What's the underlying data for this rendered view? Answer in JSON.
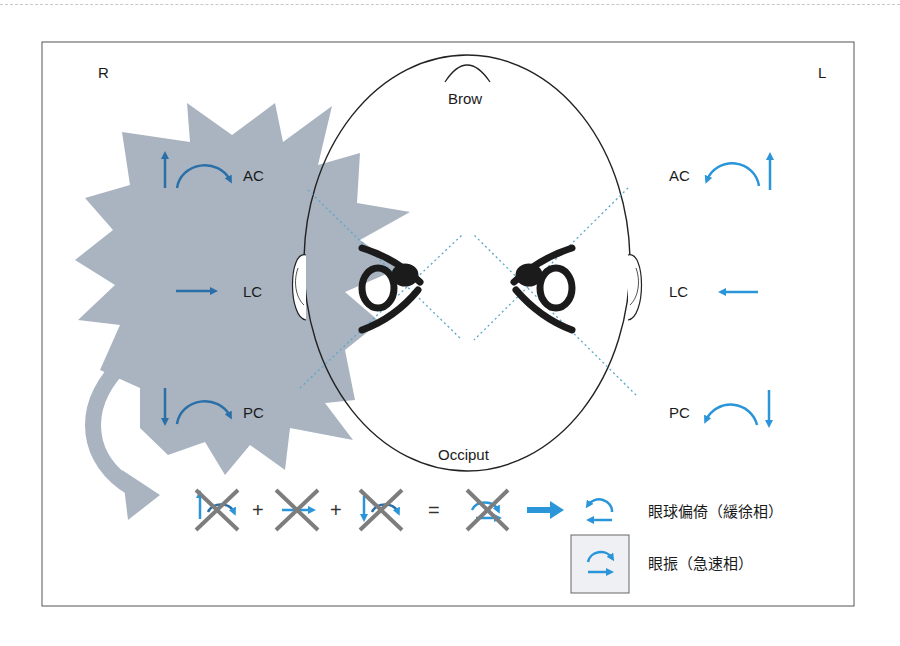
{
  "figure": {
    "side_labels": {
      "right": "R",
      "left": "L"
    },
    "head_labels": {
      "front": "Brow",
      "back": "Occiput"
    },
    "right_side": {
      "canals": [
        {
          "label": "AC",
          "linear_arrow": "up",
          "curved_arrow": "clockwise"
        },
        {
          "label": "LC",
          "linear_arrow": "right"
        },
        {
          "label": "PC",
          "linear_arrow": "down",
          "curved_arrow": "clockwise"
        }
      ],
      "highlight": "starburst (stimulated right labyrinth)"
    },
    "left_side": {
      "canals": [
        {
          "label": "AC",
          "linear_arrow": "up",
          "curved_arrow": "counterclockwise"
        },
        {
          "label": "LC",
          "linear_arrow": "left"
        },
        {
          "label": "PC",
          "linear_arrow": "down",
          "curved_arrow": "counterclockwise"
        }
      ]
    },
    "equation": {
      "plus": "+",
      "equals": "=",
      "terms": [
        "AC vector (crossed)",
        "LC vector (crossed)",
        "PC vector (crossed)"
      ],
      "result": "combined torsional vector (crossed)"
    },
    "legend": [
      {
        "label": "眼球偏倚（緩徐相）",
        "icon": "slow-phase-deviation-icon"
      },
      {
        "label": "眼振（急速相）",
        "icon": "fast-phase-nystagmus-icon"
      }
    ],
    "colors": {
      "arrow_dark_blue": "#2a6fa8",
      "arrow_light_blue": "#2a95d8",
      "starburst_gray": "#a9b4c0",
      "cross_gray": "#7d7d7d",
      "dotted_line": "#5aa6cc",
      "legend_box_bg": "#eef0f3"
    }
  }
}
